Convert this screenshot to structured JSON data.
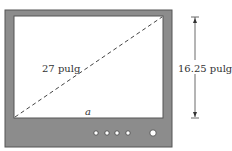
{
  "diagram": {
    "type": "tv-screen-geometry",
    "labels": {
      "diagonal": "27 pulg",
      "height": "16.25 pulg",
      "base": "a"
    },
    "colors": {
      "frame": "#8c8c8c",
      "frame_border": "#555555",
      "screen": "#ffffff",
      "text": "#333333"
    },
    "control_buttons": 5
  }
}
